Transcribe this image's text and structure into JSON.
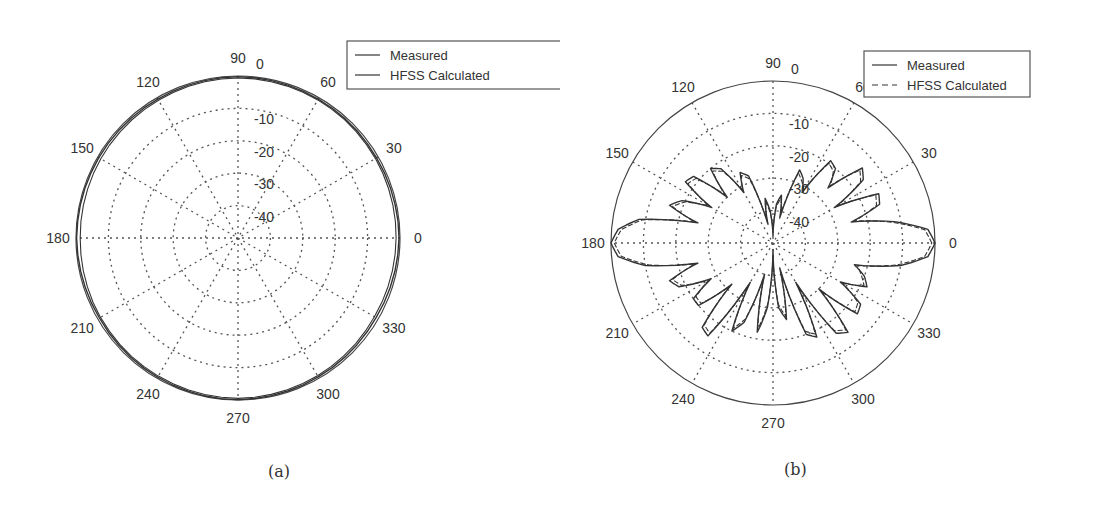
{
  "chart_data": [
    {
      "type": "line",
      "subtype": "polar",
      "panel": "a",
      "caption": "(a)",
      "title": "",
      "radial_ticks": [
        "0",
        "-10",
        "-20",
        "-30",
        "-40"
      ],
      "radial_range": [
        -50,
        0
      ],
      "angle_ticks": [
        "0",
        "30",
        "60",
        "90",
        "120",
        "150",
        "180",
        "210",
        "240",
        "270",
        "300",
        "330"
      ],
      "grid": true,
      "legend_position": "upper-right",
      "legend": [
        "Measured",
        "HFSS Calculated"
      ],
      "series": [
        {
          "name": "Measured",
          "style": "solid",
          "description": "Nearly omnidirectional, ~0 dB at all angles (about -1 dB ripple)",
          "angles": [
            0,
            30,
            60,
            90,
            120,
            150,
            180,
            210,
            240,
            270,
            300,
            330,
            360
          ],
          "values": [
            -0.3,
            -0.6,
            -0.5,
            -0.2,
            -0.5,
            -0.4,
            -0.2,
            -0.6,
            -0.4,
            -0.1,
            -0.5,
            -0.8,
            -0.3
          ]
        },
        {
          "name": "HFSS Calculated",
          "style": "solid",
          "description": "Nearly omnidirectional, ~0 dB at all angles",
          "angles": [
            0,
            30,
            60,
            90,
            120,
            150,
            180,
            210,
            240,
            270,
            300,
            330,
            360
          ],
          "values": [
            -1.2,
            -1.0,
            -0.8,
            -0.6,
            -0.9,
            -1.1,
            -1.3,
            -1.0,
            -0.8,
            -0.5,
            -0.9,
            -1.4,
            -1.2
          ]
        }
      ]
    },
    {
      "type": "line",
      "subtype": "polar",
      "panel": "b",
      "caption": "(b)",
      "title": "",
      "radial_ticks": [
        "0",
        "-10",
        "-20",
        "-30",
        "-40"
      ],
      "radial_range": [
        -50,
        0
      ],
      "angle_ticks": [
        "0",
        "30",
        "60",
        "90",
        "120",
        "150",
        "180",
        "210",
        "240",
        "270",
        "300",
        "330"
      ],
      "grid": true,
      "legend_position": "upper-right",
      "legend": [
        "Measured",
        "HFSS Calculated"
      ],
      "series": [
        {
          "name": "Measured",
          "style": "solid",
          "description": "Main lobes at 0 and 180 deg (~0 dB), many side lobes around -15 to -30 dB, deep nulls near 90/270",
          "angles": [
            0,
            5,
            10,
            15,
            20,
            25,
            30,
            35,
            40,
            45,
            50,
            55,
            60,
            65,
            70,
            75,
            80,
            85,
            90,
            95,
            100,
            105,
            110,
            115,
            120,
            125,
            130,
            135,
            140,
            145,
            150,
            155,
            160,
            165,
            170,
            175,
            180,
            185,
            190,
            195,
            200,
            205,
            210,
            215,
            220,
            225,
            230,
            235,
            240,
            245,
            250,
            255,
            260,
            265,
            270,
            275,
            280,
            285,
            290,
            295,
            300,
            305,
            310,
            315,
            320,
            325,
            330,
            335,
            340,
            345,
            350,
            355,
            360
          ],
          "values": [
            0,
            -2,
            -12,
            -25,
            -15,
            -14,
            -28,
            -16,
            -14,
            -26,
            -20,
            -19,
            -32,
            -28,
            -26,
            -42,
            -35,
            -38,
            -48,
            -40,
            -36,
            -44,
            -28,
            -26,
            -32,
            -22,
            -20,
            -30,
            -18,
            -17,
            -28,
            -19,
            -16,
            -26,
            -8,
            -2,
            0,
            -2,
            -10,
            -26,
            -16,
            -18,
            -28,
            -20,
            -20,
            -32,
            -16,
            -15,
            -36,
            -20,
            -24,
            -40,
            -22,
            -30,
            -48,
            -30,
            -26,
            -42,
            -20,
            -18,
            -36,
            -16,
            -14,
            -30,
            -16,
            -17,
            -26,
            -18,
            -20,
            -24,
            -10,
            -2,
            0
          ]
        },
        {
          "name": "HFSS Calculated",
          "style": "dashed",
          "description": "Closely follows measured pattern with slight offsets",
          "angles": [
            0,
            5,
            10,
            15,
            20,
            25,
            30,
            35,
            40,
            45,
            50,
            55,
            60,
            65,
            70,
            75,
            80,
            85,
            90,
            95,
            100,
            105,
            110,
            115,
            120,
            125,
            130,
            135,
            140,
            145,
            150,
            155,
            160,
            165,
            170,
            175,
            180,
            185,
            190,
            195,
            200,
            205,
            210,
            215,
            220,
            225,
            230,
            235,
            240,
            245,
            250,
            255,
            260,
            265,
            270,
            275,
            280,
            285,
            290,
            295,
            300,
            305,
            310,
            315,
            320,
            325,
            330,
            335,
            340,
            345,
            350,
            355,
            360
          ],
          "values": [
            -1,
            -3,
            -13,
            -24,
            -16,
            -15,
            -27,
            -17,
            -15,
            -25,
            -21,
            -20,
            -31,
            -29,
            -27,
            -40,
            -36,
            -39,
            -46,
            -41,
            -37,
            -43,
            -29,
            -27,
            -31,
            -23,
            -21,
            -29,
            -19,
            -18,
            -27,
            -20,
            -17,
            -25,
            -9,
            -3,
            -1,
            -3,
            -11,
            -25,
            -17,
            -19,
            -27,
            -21,
            -21,
            -31,
            -17,
            -16,
            -35,
            -21,
            -25,
            -39,
            -23,
            -31,
            -46,
            -31,
            -27,
            -41,
            -21,
            -19,
            -35,
            -17,
            -15,
            -29,
            -17,
            -18,
            -25,
            -19,
            -21,
            -23,
            -11,
            -3,
            -1
          ]
        }
      ]
    }
  ],
  "captions": {
    "a": "(a)",
    "b": "(b)"
  },
  "legend": {
    "measured": "Measured",
    "hfss": "HFSS Calculated"
  },
  "colors": {
    "grid": "#555555",
    "line": "#333333",
    "axis": "#444444"
  }
}
